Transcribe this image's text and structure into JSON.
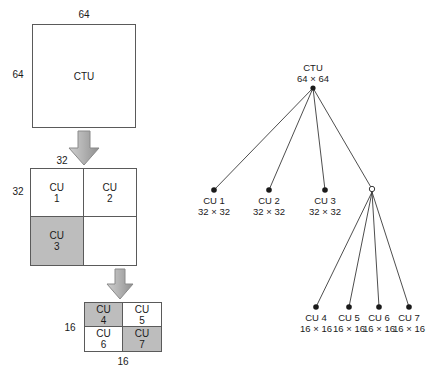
{
  "figure": {
    "colors": {
      "stroke": "#5a5a5a",
      "line": "#3a3a3a",
      "shaded_fill": "#bdbdbd",
      "plain_fill": "#ffffff",
      "arrow_fill": "#b0b0b0",
      "text": "#1a1a1a"
    }
  },
  "blocks": {
    "ctu": {
      "label": "CTU",
      "width_label": "64",
      "height_label": "64"
    },
    "level1": {
      "width_label": "32",
      "height_label": "32",
      "cells": [
        {
          "name": "CU",
          "number": "1",
          "shaded": false
        },
        {
          "name": "CU",
          "number": "2",
          "shaded": false
        },
        {
          "name": "CU",
          "number": "3",
          "shaded": true
        },
        {
          "name": "",
          "number": "",
          "shaded": false
        }
      ]
    },
    "level2": {
      "width_label": "16",
      "height_label": "16",
      "cells": [
        {
          "name": "CU",
          "number": "4",
          "shaded": true
        },
        {
          "name": "CU",
          "number": "5",
          "shaded": false
        },
        {
          "name": "CU",
          "number": "6",
          "shaded": false
        },
        {
          "name": "CU",
          "number": "7",
          "shaded": true
        }
      ]
    }
  },
  "arrows": {
    "first": "down-arrow",
    "second": "down-arrow"
  },
  "tree": {
    "root": {
      "label": "CTU",
      "size": "64 × 64",
      "filled": true
    },
    "level1_nodes": [
      {
        "label": "CU 1",
        "size": "32 × 32",
        "filled": true
      },
      {
        "label": "CU 2",
        "size": "32 × 32",
        "filled": true
      },
      {
        "label": "CU 3",
        "size": "32 × 32",
        "filled": true
      },
      {
        "label": "",
        "size": "",
        "filled": false
      }
    ],
    "level2_nodes": [
      {
        "label": "CU 4",
        "size": "16 × 16",
        "filled": true
      },
      {
        "label": "CU 5",
        "size": "16 × 16",
        "filled": true
      },
      {
        "label": "CU 6",
        "size": "16 × 16",
        "filled": true
      },
      {
        "label": "CU 7",
        "size": "16 × 16",
        "filled": true
      }
    ]
  }
}
